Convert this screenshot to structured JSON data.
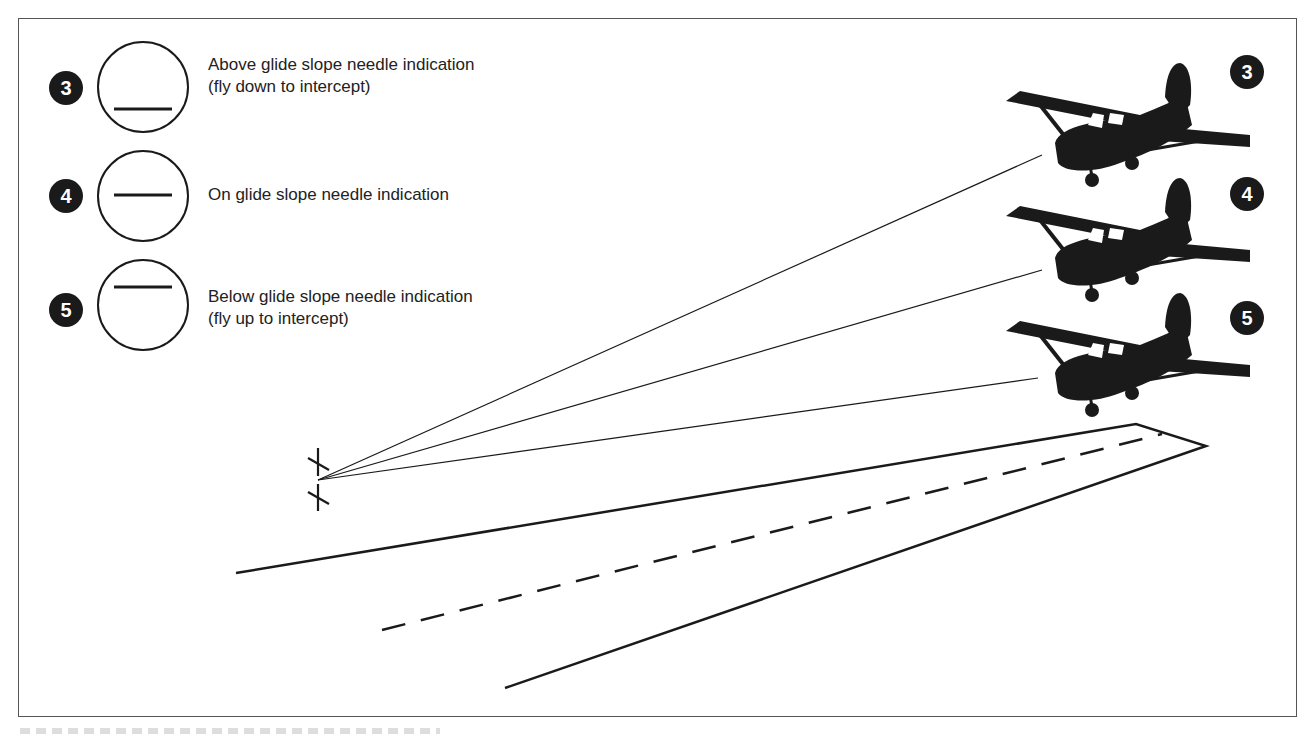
{
  "legend": [
    {
      "number": "3",
      "needle": "low",
      "line1": "Above glide slope needle indication",
      "line2": "(fly down to intercept)"
    },
    {
      "number": "4",
      "needle": "center",
      "line1": "On glide slope needle indication",
      "line2": ""
    },
    {
      "number": "5",
      "needle": "high",
      "line1": "Below glide slope needle indication",
      "line2": "(fly up to intercept)"
    }
  ],
  "aircraft": [
    {
      "number": "3",
      "position": "above glide slope"
    },
    {
      "number": "4",
      "position": "on glide slope"
    },
    {
      "number": "5",
      "position": "below glide slope"
    }
  ],
  "colors": {
    "ink": "#1a1a1a",
    "frame": "#555555",
    "background": "#ffffff"
  }
}
